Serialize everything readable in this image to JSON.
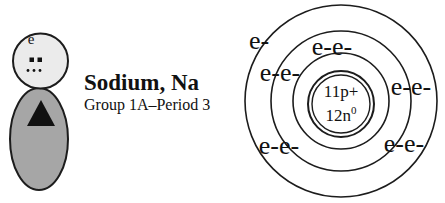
{
  "element": {
    "title": "Sodium, Na",
    "group_period": "Group 1A–Period 3"
  },
  "figure": {
    "electron_label": "e"
  },
  "bohr_model": {
    "nucleus": {
      "protons": "11p+",
      "neutrons": "12n",
      "neutrons_superscript": "0"
    },
    "shells": [
      {
        "shell": 1,
        "electrons": 2
      },
      {
        "shell": 2,
        "electrons": 8
      },
      {
        "shell": 3,
        "electrons": 1
      }
    ],
    "electron_labels": [
      {
        "text": "e-",
        "shell": 3,
        "position": "outer-top-left"
      },
      {
        "text": "e-e-",
        "shell": 1,
        "position": "top"
      },
      {
        "text": "e-e-",
        "shell": 2,
        "position": "upper-left"
      },
      {
        "text": "e-e-",
        "shell": 2,
        "position": "right"
      },
      {
        "text": "e-e-",
        "shell": 2,
        "position": "lower-left"
      },
      {
        "text": "e-e-",
        "shell": 2,
        "position": "lower-right"
      }
    ]
  },
  "colors": {
    "background": "#ffffff",
    "line": "#1c1c1c",
    "head_fill": "#ebebeb",
    "body_fill": "#a6a6a6",
    "dot": "#111111"
  }
}
